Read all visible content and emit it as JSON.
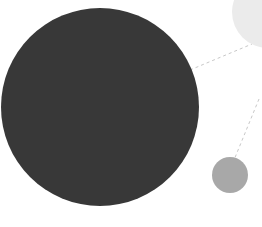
{
  "canvas": {
    "width": 262,
    "height": 227,
    "background": "#ffffff",
    "title": "Bubble cluster diagram"
  },
  "palette": {
    "primary_node": "#383838",
    "secondary_node": "#ebebeb",
    "tertiary_node": "#a8a8a8",
    "connector": "#c8c8c8"
  },
  "chart_data": {
    "type": "scatter",
    "subtitle": "",
    "xlabel": "",
    "ylabel": "",
    "xlim": [
      0,
      262
    ],
    "ylim": [
      0,
      227
    ],
    "grid": false,
    "legend": "none",
    "annotations": [],
    "series": [
      {
        "name": "nodes",
        "points": [
          {
            "id": "primary",
            "label": "",
            "x": 100,
            "y": 107,
            "r": 99,
            "color": "#383838",
            "value": 99
          },
          {
            "id": "secondary",
            "label": "",
            "x": 268,
            "y": 12,
            "r": 36,
            "color": "#ebebeb",
            "value": 36
          },
          {
            "id": "tertiary",
            "label": "",
            "x": 230,
            "y": 175,
            "r": 18,
            "color": "#a8a8a8",
            "value": 18
          }
        ]
      }
    ],
    "links": [
      {
        "id": "primary-to-secondary",
        "from": "primary",
        "to": "secondary",
        "x1": 190,
        "y1": 70,
        "x2": 252,
        "y2": 44,
        "style": "dashed",
        "color": "#c8c8c8"
      },
      {
        "id": "secondary-to-tertiary",
        "from": "secondary",
        "to": "tertiary",
        "x1": 259,
        "y1": 99,
        "x2": 234,
        "y2": 160,
        "style": "dashed",
        "color": "#c8c8c8"
      }
    ]
  },
  "nodes": {
    "primary": {
      "name": "primary-node",
      "cx": 100,
      "cy": 107,
      "r": 99,
      "fill": "#383838"
    },
    "secondary": {
      "name": "secondary-node",
      "cx": 268,
      "cy": 12,
      "r": 36,
      "fill": "#ebebeb"
    },
    "tertiary": {
      "name": "tertiary-node",
      "cx": 230,
      "cy": 175,
      "r": 18,
      "fill": "#a8a8a8"
    }
  },
  "links": {
    "upper": {
      "name": "upper-connector",
      "x1": 190,
      "y1": 70,
      "x2": 252,
      "y2": 44,
      "stroke": "#c8c8c8",
      "dash": "3 3",
      "width": 1
    },
    "lower": {
      "name": "lower-connector",
      "x1": 259,
      "y1": 99,
      "x2": 234,
      "y2": 160,
      "stroke": "#c8c8c8",
      "dash": "3 3",
      "width": 1
    }
  }
}
